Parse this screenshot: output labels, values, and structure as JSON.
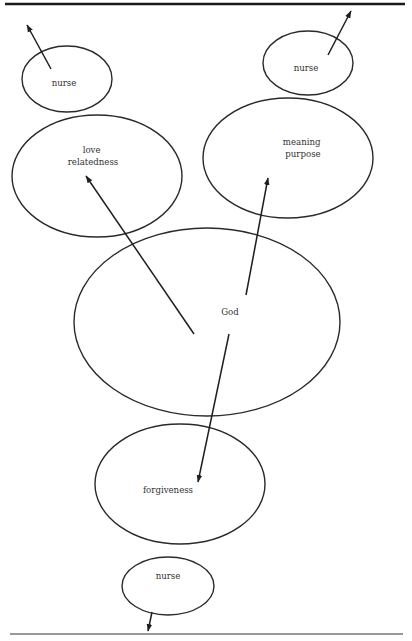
{
  "diagram": {
    "type": "concept-map",
    "rules": {
      "top": {
        "x1": 5,
        "y1": 4,
        "x2": 405,
        "y2": 4
      },
      "bottom": {
        "x1": 10,
        "y1": 634,
        "x2": 403,
        "y2": 634
      }
    },
    "nodes": [
      {
        "id": "nurse-top-left",
        "lines": [
          "nurse"
        ],
        "cx": 67,
        "cy": 79,
        "rx": 45,
        "ry": 33,
        "label_x": 64,
        "label_y": 86
      },
      {
        "id": "nurse-top-right",
        "lines": [
          "nurse"
        ],
        "cx": 308,
        "cy": 63,
        "rx": 45,
        "ry": 32,
        "label_x": 306,
        "label_y": 71
      },
      {
        "id": "love-relatedness",
        "lines": [
          "love",
          "relatedness"
        ],
        "cx": 97,
        "cy": 176,
        "rx": 85,
        "ry": 61,
        "label_x": 93,
        "label_y": 153
      },
      {
        "id": "meaning-purpose",
        "lines": [
          "meaning",
          "purpose"
        ],
        "cx": 288,
        "cy": 158,
        "rx": 85,
        "ry": 60,
        "label_x": 303,
        "label_y": 145
      },
      {
        "id": "god",
        "lines": [
          "God"
        ],
        "cx": 207,
        "cy": 322,
        "rx": 133,
        "ry": 94,
        "label_x": 230,
        "label_y": 315
      },
      {
        "id": "forgiveness",
        "lines": [
          "forgiveness"
        ],
        "cx": 180,
        "cy": 484,
        "rx": 85,
        "ry": 60,
        "label_x": 168,
        "label_y": 493
      },
      {
        "id": "nurse-bottom",
        "lines": [
          "nurse"
        ],
        "cx": 168,
        "cy": 586,
        "rx": 46,
        "ry": 29,
        "label_x": 168,
        "label_y": 579
      }
    ],
    "arrows": [
      {
        "id": "arrow-nurse-top-left-out",
        "x1": 51,
        "y1": 69,
        "x2": 27,
        "y2": 25
      },
      {
        "id": "arrow-nurse-top-right-out",
        "x1": 328,
        "y1": 55,
        "x2": 351,
        "y2": 11
      },
      {
        "id": "arrow-god-to-love",
        "x1": 194,
        "y1": 334,
        "x2": 86,
        "y2": 176
      },
      {
        "id": "arrow-god-to-meaning",
        "x1": 246,
        "y1": 295,
        "x2": 268,
        "y2": 178
      },
      {
        "id": "arrow-god-to-forgiveness",
        "x1": 229,
        "y1": 334,
        "x2": 198,
        "y2": 482
      },
      {
        "id": "arrow-nurse-bottom-out",
        "x1": 152,
        "y1": 612,
        "x2": 148,
        "y2": 631
      }
    ],
    "colors": {
      "stroke": "#2a2a2a",
      "text": "#333333",
      "background": "#ffffff"
    }
  }
}
